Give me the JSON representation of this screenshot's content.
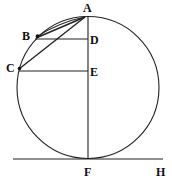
{
  "diagram": {
    "type": "geometry",
    "points": {
      "A": {
        "label": "A",
        "x": 88,
        "y": 16
      },
      "B": {
        "label": "B",
        "x": 37,
        "y": 36
      },
      "C": {
        "label": "C",
        "x": 19,
        "y": 68
      },
      "D": {
        "label": "D",
        "x": 88,
        "y": 39
      },
      "E": {
        "label": "E",
        "x": 88,
        "y": 71
      },
      "F": {
        "label": "F",
        "x": 88,
        "y": 158
      },
      "H": {
        "label": "H",
        "x": 160,
        "y": 158
      }
    },
    "segments": [
      "AF",
      "AB",
      "AC",
      "BD",
      "CE",
      "FH"
    ],
    "arcs": [
      "AB"
    ],
    "circle": {
      "cx": 88,
      "cy": 87,
      "r": 71
    }
  },
  "labels": {
    "A": "A",
    "B": "B",
    "C": "C",
    "D": "D",
    "E": "E",
    "F": "F",
    "H": "H"
  },
  "colors": {
    "stroke": "#222222",
    "background": "#ffffff"
  }
}
